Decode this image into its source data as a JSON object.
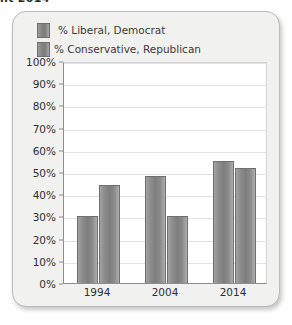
{
  "top_fragment": "nt 2014",
  "panel": {
    "background_color": "#f1f1f0",
    "border_color": "#b9b9b7"
  },
  "legend": {
    "position": "top-left",
    "entries": [
      {
        "label": "% Liberal, Democrat",
        "color": "#8a8a8a"
      },
      {
        "label": "% Conservative, Republican",
        "color": "#8a8a8a"
      }
    ]
  },
  "chart_data": {
    "type": "bar",
    "title": "",
    "subtitle": "",
    "xlabel": "",
    "ylabel": "",
    "categories": [
      "1994",
      "2004",
      "2014"
    ],
    "series": [
      {
        "name": "% Liberal, Democrat",
        "color": "#8a8a8a",
        "values": [
          30,
          48,
          55
        ]
      },
      {
        "name": "% Conservative, Republican",
        "color": "#8a8a8a",
        "values": [
          44,
          30,
          52
        ]
      }
    ],
    "ylim": [
      0,
      100
    ],
    "y_tick_values": [
      0,
      10,
      20,
      30,
      40,
      50,
      60,
      70,
      80,
      90,
      100
    ],
    "y_tick_labels": [
      "0%",
      "10%",
      "20%",
      "30%",
      "40%",
      "50%",
      "60%",
      "70%",
      "80%",
      "90%",
      "100%"
    ],
    "grid": true,
    "grid_axis": "y",
    "legend_position": "top-left",
    "value_format": "percent"
  }
}
